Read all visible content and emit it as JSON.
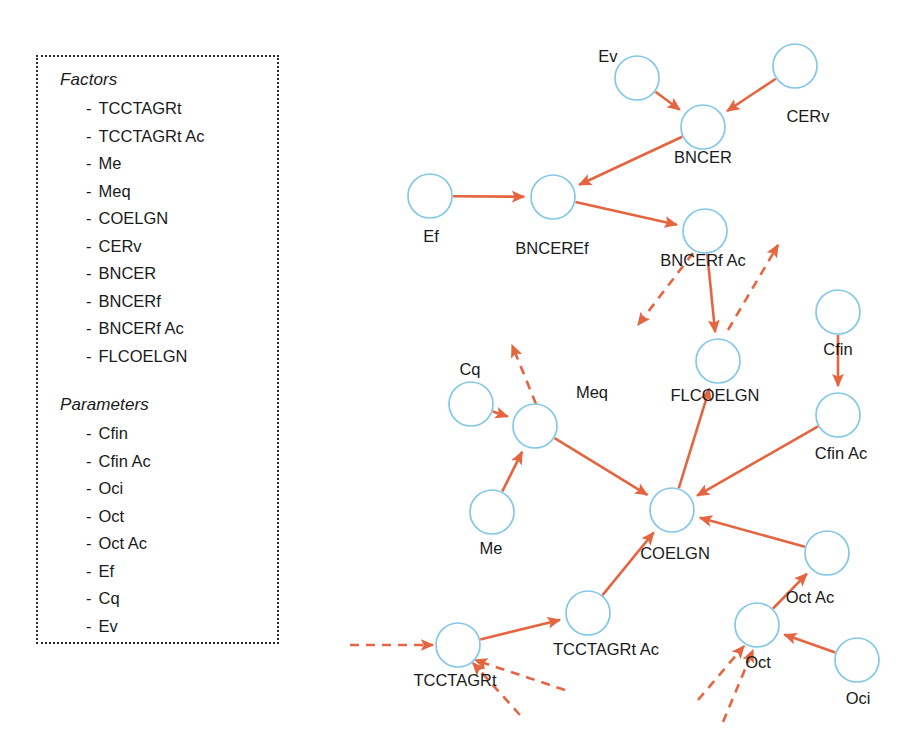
{
  "legend": {
    "factors_heading": "Factors",
    "factors": [
      "TCCTAGRt",
      "TCCTAGRt Ac",
      "Me",
      "Meq",
      "COELGN",
      "CERv",
      "BNCER",
      "BNCERf",
      "BNCERf Ac",
      "FLCOELGN"
    ],
    "parameters_heading": "Parameters",
    "parameters": [
      "Cfin",
      "Cfin Ac",
      "Oci",
      "Oct",
      "Oct Ac",
      "Ef",
      "Cq",
      "Ev"
    ],
    "bullet": "-"
  },
  "colors": {
    "node_stroke": "#84c8e8",
    "edge": "#e4653f",
    "text": "#1a1a1a",
    "legend_border": "#2b2b2b",
    "background": "#ffffff"
  },
  "diagram": {
    "type": "causal-graph",
    "node_radius": 22,
    "nodes": [
      {
        "id": "Ev",
        "label": "Ev",
        "x": 307,
        "y": 78,
        "label_x": 278,
        "label_y": 48,
        "label_align": "center"
      },
      {
        "id": "CERv",
        "label": "CERv",
        "x": 465,
        "y": 66,
        "label_x": 478,
        "label_y": 108,
        "label_align": "center"
      },
      {
        "id": "BNCER",
        "label": "BNCER",
        "x": 373,
        "y": 127,
        "label_x": 373,
        "label_y": 149,
        "label_align": "center"
      },
      {
        "id": "Ef",
        "label": "Ef",
        "x": 100,
        "y": 196,
        "label_x": 101,
        "label_y": 228,
        "label_align": "center"
      },
      {
        "id": "BNCEREf",
        "label": "BNCEREf",
        "x": 223,
        "y": 197,
        "label_x": 222,
        "label_y": 240,
        "label_align": "center"
      },
      {
        "id": "BNCERfAc",
        "label": "BNCERf Ac",
        "x": 375,
        "y": 231,
        "label_x": 373,
        "label_y": 252,
        "label_align": "center"
      },
      {
        "id": "FLCOELGN",
        "label": "FLCOELGN",
        "x": 388,
        "y": 361,
        "label_x": 385,
        "label_y": 387,
        "label_align": "center"
      },
      {
        "id": "Cfin",
        "label": "Cfin",
        "x": 508,
        "y": 312,
        "label_x": 508,
        "label_y": 341,
        "label_align": "center"
      },
      {
        "id": "CfinAc",
        "label": "Cfin Ac",
        "x": 508,
        "y": 415,
        "label_x": 511,
        "label_y": 445,
        "label_align": "center"
      },
      {
        "id": "Cq",
        "label": "Cq",
        "x": 141,
        "y": 404,
        "label_x": 140,
        "label_y": 361,
        "label_align": "center"
      },
      {
        "id": "Meq",
        "label": "Meq",
        "x": 205,
        "y": 426,
        "label_x": 262,
        "label_y": 384,
        "label_align": "center"
      },
      {
        "id": "Me",
        "label": "Me",
        "x": 162,
        "y": 512,
        "label_x": 161,
        "label_y": 540,
        "label_align": "center"
      },
      {
        "id": "COELGN",
        "label": "COELGN",
        "x": 342,
        "y": 510,
        "label_x": 345,
        "label_y": 545,
        "label_align": "center"
      },
      {
        "id": "OctAc",
        "label": "Oct Ac",
        "x": 497,
        "y": 553,
        "label_x": 480,
        "label_y": 589,
        "label_align": "center"
      },
      {
        "id": "Oct",
        "label": "Oct",
        "x": 427,
        "y": 625,
        "label_x": 428,
        "label_y": 654,
        "label_align": "center"
      },
      {
        "id": "Oci",
        "label": "Oci",
        "x": 527,
        "y": 660,
        "label_x": 528,
        "label_y": 690,
        "label_align": "center"
      },
      {
        "id": "TCCTAGRtAc",
        "label": "TCCTAGRt Ac",
        "x": 258,
        "y": 613,
        "label_x": 276,
        "label_y": 641,
        "label_align": "center"
      },
      {
        "id": "TCCTAGRt",
        "label": "TCCTAGRt",
        "x": 128,
        "y": 645,
        "label_x": 125,
        "label_y": 672,
        "label_align": "center"
      }
    ],
    "edges": [
      {
        "from": "Ev",
        "to": "BNCER",
        "style": "solid"
      },
      {
        "from": "CERv",
        "to": "BNCER",
        "style": "solid"
      },
      {
        "from": "BNCER",
        "to": "BNCEREf",
        "style": "solid"
      },
      {
        "from": "Ef",
        "to": "BNCEREf",
        "style": "solid"
      },
      {
        "from": "BNCEREf",
        "to": "BNCERfAc",
        "style": "solid"
      },
      {
        "from": "BNCERfAc",
        "to": "FLCOELGN",
        "style": "solid"
      },
      {
        "from": "Cfin",
        "to": "CfinAc",
        "style": "solid"
      },
      {
        "from": "CfinAc",
        "to": "COELGN",
        "style": "solid"
      },
      {
        "from": "Cq",
        "to": "Meq",
        "style": "solid"
      },
      {
        "from": "Me",
        "to": "Meq",
        "style": "solid"
      },
      {
        "from": "Meq",
        "to": "COELGN",
        "style": "solid"
      },
      {
        "from": "COELGN",
        "to": "FLCOELGN",
        "style": "solid"
      },
      {
        "from": "Oci",
        "to": "Oct",
        "style": "solid"
      },
      {
        "from": "Oct",
        "to": "OctAc",
        "style": "solid"
      },
      {
        "from": "OctAc",
        "to": "COELGN",
        "style": "solid"
      },
      {
        "from": "TCCTAGRt",
        "to": "TCCTAGRtAc",
        "style": "solid"
      },
      {
        "from": "TCCTAGRtAc",
        "to": "COELGN",
        "style": "solid"
      }
    ],
    "open_edges": [
      {
        "name": "bncerfac-out-downleft",
        "style": "dashed",
        "x1": 363,
        "y1": 253,
        "x2": 308,
        "y2": 325
      },
      {
        "name": "bncerfac-out-upright",
        "style": "dashed",
        "x1": 398,
        "y1": 330,
        "x2": 448,
        "y2": 245
      },
      {
        "name": "meq-out-upleft",
        "style": "dashed",
        "x1": 206,
        "y1": 404,
        "x2": 182,
        "y2": 345
      },
      {
        "name": "tcctagrt-in-left",
        "style": "dashed",
        "x1": 20,
        "y1": 645,
        "x2": 103,
        "y2": 645
      },
      {
        "name": "tcctagrt-in-lowright1",
        "style": "dashed",
        "x1": 235,
        "y1": 690,
        "x2": 145,
        "y2": 660
      },
      {
        "name": "tcctagrt-in-lowright2",
        "style": "dashed",
        "x1": 190,
        "y1": 715,
        "x2": 143,
        "y2": 663
      },
      {
        "name": "oct-in-lowleft1",
        "style": "dashed",
        "x1": 368,
        "y1": 700,
        "x2": 414,
        "y2": 646
      },
      {
        "name": "oct-in-lowleft2",
        "style": "dashed",
        "x1": 393,
        "y1": 722,
        "x2": 423,
        "y2": 650
      }
    ]
  }
}
